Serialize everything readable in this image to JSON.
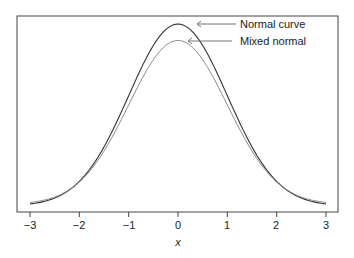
{
  "chart_data": {
    "type": "line",
    "title": "",
    "xlabel": "x",
    "ylabel": "",
    "xlim": [
      -3,
      3
    ],
    "x_ticks": [
      -3,
      -2,
      -1,
      0,
      1,
      2,
      3
    ],
    "x_tick_labels": [
      "−3",
      "−2",
      "−1",
      "0",
      "1",
      "2",
      "3"
    ],
    "y_ticks": [],
    "grid": false,
    "legend": "annotations with arrows, top right of peak",
    "series": [
      {
        "name": "Normal curve",
        "color": "#333333",
        "x": [
          -3,
          -2.5,
          -2,
          -1.5,
          -1,
          -0.5,
          0,
          0.5,
          1,
          1.5,
          2,
          2.5,
          3
        ],
        "values": [
          0.0044,
          0.0175,
          0.054,
          0.1295,
          0.242,
          0.352,
          0.399,
          0.352,
          0.242,
          0.1295,
          0.054,
          0.0175,
          0.0044
        ]
      },
      {
        "name": "Mixed normal",
        "color": "#888888",
        "x": [
          -3,
          -2.5,
          -2,
          -1.5,
          -1,
          -0.5,
          0,
          0.5,
          1,
          1.5,
          2,
          2.5,
          3
        ],
        "values": [
          0.0078,
          0.0196,
          0.0525,
          0.12,
          0.222,
          0.321,
          0.363,
          0.321,
          0.222,
          0.12,
          0.0525,
          0.0196,
          0.0078
        ]
      }
    ],
    "annotations": [
      {
        "text": "Normal curve",
        "arrow_to_x": 0.3
      },
      {
        "text": "Mixed normal",
        "arrow_to_x": 0.2
      }
    ]
  },
  "labels": {
    "xlabel": "x",
    "annot_normal": "Normal curve",
    "annot_mixed": "Mixed normal",
    "ticks": [
      "−3",
      "−2",
      "−1",
      "0",
      "1",
      "2",
      "3"
    ]
  }
}
